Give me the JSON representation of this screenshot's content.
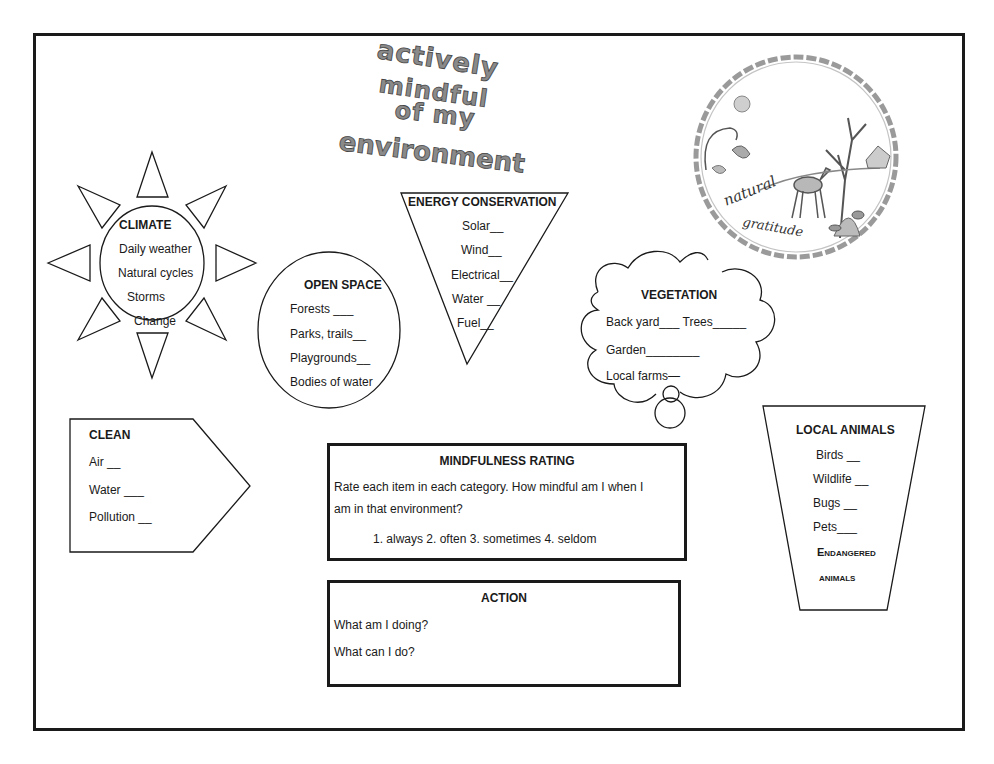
{
  "title": {
    "lines": [
      "actively",
      "mindful",
      "of my",
      "environment"
    ]
  },
  "artwork": {
    "label_top": "natural",
    "label_bottom": "gratitude"
  },
  "climate": {
    "heading": "CLIMATE",
    "items": [
      "Daily weather",
      "Natural cycles",
      "Storms",
      "Change"
    ]
  },
  "open_space": {
    "heading": "OPEN SPACE",
    "items": [
      "Forests ___",
      "Parks, trails__",
      "Playgrounds__",
      "Bodies of water"
    ]
  },
  "energy": {
    "heading": "ENERGY CONSERVATION",
    "items": [
      "Solar__",
      "Wind__",
      "Electrical__",
      "Water __",
      "Fuel__"
    ]
  },
  "vegetation": {
    "heading": "VEGETATION",
    "items": [
      "Back yard___ Trees_____",
      "Garden________",
      "Local farms—"
    ]
  },
  "clean": {
    "heading": "CLEAN",
    "items": [
      "Air __",
      "Water ___",
      "Pollution __"
    ]
  },
  "mindfulness": {
    "heading": "MINDFULNESS RATING",
    "instruction_line1": "Rate each item in each category.  How mindful am I when I",
    "instruction_line2": "am in that environment?",
    "scale": "1. always  2.  often   3. sometimes  4. seldom"
  },
  "action": {
    "heading": "ACTION",
    "questions": [
      "What am I doing?",
      "What can I do?"
    ]
  },
  "local_animals": {
    "heading": "LOCAL  ANIMALS",
    "items": [
      "Birds __",
      "Wildlife __",
      "Bugs __",
      "Pets___"
    ],
    "sub_heading_line1": "Endangered",
    "sub_heading_line2": "animals"
  },
  "colors": {
    "ink": "#1a1a1a",
    "title_fill": "#8a8a8a",
    "background": "#ffffff"
  }
}
